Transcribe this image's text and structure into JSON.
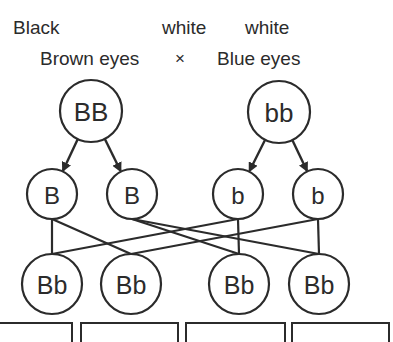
{
  "header": {
    "parent1_color": "Black",
    "parent1_eyes": "Brown eyes",
    "cross_symbol": "×",
    "parent2_color_a": "white",
    "parent2_color_b": "white",
    "parent2_eyes": "Blue eyes"
  },
  "parents": [
    {
      "genotype": "BB",
      "cx": 91,
      "cy": 111,
      "r": 31
    },
    {
      "genotype": "bb",
      "cx": 279,
      "cy": 112,
      "r": 31
    }
  ],
  "gametes": [
    {
      "allele": "B",
      "cx": 52,
      "cy": 194,
      "r": 25,
      "from": 0
    },
    {
      "allele": "B",
      "cx": 132,
      "cy": 194,
      "r": 25,
      "from": 0
    },
    {
      "allele": "b",
      "cx": 238,
      "cy": 194,
      "r": 25,
      "from": 1
    },
    {
      "allele": "b",
      "cx": 318,
      "cy": 194,
      "r": 25,
      "from": 1
    }
  ],
  "offspring": [
    {
      "genotype": "Bb",
      "cx": 52,
      "cy": 284,
      "r": 30
    },
    {
      "genotype": "Bb",
      "cx": 131,
      "cy": 284,
      "r": 30
    },
    {
      "genotype": "Bb",
      "cx": 239,
      "cy": 284,
      "r": 30
    },
    {
      "genotype": "Bb",
      "cx": 319,
      "cy": 284,
      "r": 30
    }
  ],
  "connections": [
    {
      "gamete": 0,
      "offspring": 0
    },
    {
      "gamete": 0,
      "offspring": 1
    },
    {
      "gamete": 1,
      "offspring": 2
    },
    {
      "gamete": 1,
      "offspring": 3
    },
    {
      "gamete": 2,
      "offspring": 0
    },
    {
      "gamete": 2,
      "offspring": 2
    },
    {
      "gamete": 3,
      "offspring": 1
    },
    {
      "gamete": 3,
      "offspring": 3
    }
  ],
  "bottom_boxes": [
    {
      "left": -2,
      "width": 75
    },
    {
      "left": 80,
      "width": 99
    },
    {
      "left": 185,
      "width": 101
    },
    {
      "left": 291,
      "width": 99
    }
  ],
  "colors": {
    "stroke": "#2b2b2b",
    "background": "#ffffff"
  }
}
